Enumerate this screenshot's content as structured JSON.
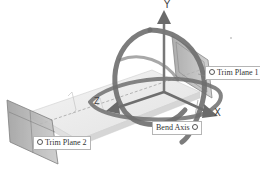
{
  "viewport": {
    "background": "#ffffff",
    "manipulator_color": "#6e6e6e",
    "plane_color": "#8a8a8a"
  },
  "axes": {
    "y_label": "Y",
    "x_label": "X",
    "z_label": "Z"
  },
  "labels": {
    "trim_plane_1": "Trim Plane 1",
    "trim_plane_2": "Trim Plane 2",
    "bend_axis": "Bend Axis"
  }
}
